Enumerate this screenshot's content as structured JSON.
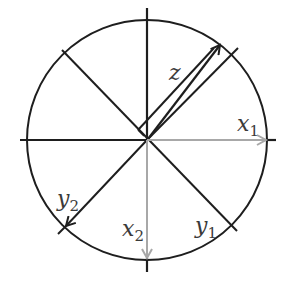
{
  "diagram": {
    "title": "",
    "colors": {
      "stroke": "#1e1e1e",
      "gray_arrow": "#a8a8a8",
      "label": "#3a3a3a",
      "background": "#ffffff"
    },
    "labels": {
      "z": {
        "base": "z",
        "sub": ""
      },
      "x1": {
        "base": "x",
        "sub": "1"
      },
      "x2": {
        "base": "x",
        "sub": "2"
      },
      "y1": {
        "base": "y",
        "sub": "1"
      },
      "y2": {
        "base": "y",
        "sub": "2"
      }
    },
    "elements": [
      "circle",
      "horizontal-axis",
      "vertical-axis",
      "diagonal-nw-se",
      "diagonal-ne-sw",
      "vector-z",
      "vector-x1",
      "vector-x2",
      "vector-y1",
      "vector-y2"
    ]
  }
}
